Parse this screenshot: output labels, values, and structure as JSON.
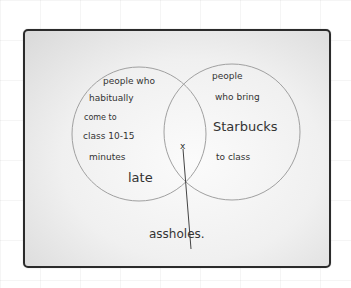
{
  "diagram": {
    "type": "venn",
    "left_set": {
      "lines": [
        "people who",
        "habitually",
        "come to",
        "class 10-15",
        "minutes",
        "late"
      ]
    },
    "right_set": {
      "lines": [
        "people",
        "who bring",
        "Starbucks",
        "to class"
      ]
    },
    "intersection_marker": "x",
    "intersection_label": "assholes."
  },
  "colors": {
    "frame": "#2b2b2b",
    "circle": "#9a9a9a",
    "ink": "#333333"
  }
}
